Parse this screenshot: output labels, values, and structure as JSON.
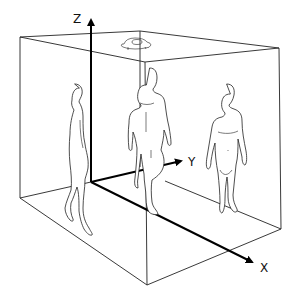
{
  "diagram": {
    "type": "3d-room-coordinate-system",
    "axes": {
      "x": {
        "label": "X"
      },
      "y": {
        "label": "Y"
      },
      "z": {
        "label": "Z"
      }
    },
    "elements": [
      {
        "name": "room-box",
        "description": "wireframe rectangular room"
      },
      {
        "name": "ceiling-sensor",
        "description": "sensor device mounted on ceiling"
      },
      {
        "name": "person-left",
        "description": "person walking, side view"
      },
      {
        "name": "person-center",
        "description": "person walking toward viewer"
      },
      {
        "name": "person-right",
        "description": "person standing, front view"
      }
    ],
    "colors": {
      "line": "#222222",
      "axis": "#000000",
      "background": "#ffffff"
    }
  }
}
